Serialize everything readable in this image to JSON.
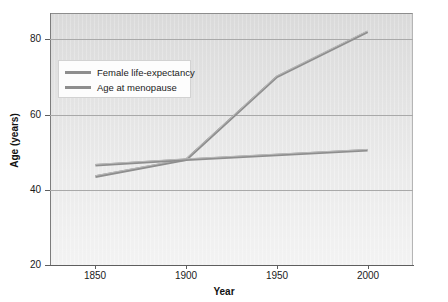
{
  "chart_data": {
    "type": "line",
    "title": "",
    "xlabel": "Year",
    "ylabel": "Age (years)",
    "xlim": [
      1825,
      2025
    ],
    "ylim": [
      20,
      87
    ],
    "xticks": [
      1850,
      1900,
      1950,
      2000
    ],
    "yticks": [
      20,
      40,
      60,
      80
    ],
    "xtick_labels": [
      "1850",
      "1900",
      "1950",
      "2000"
    ],
    "ytick_labels": [
      "20",
      "40",
      "60",
      "80"
    ],
    "grid": "horizontal",
    "legend_position": "upper-left-inside",
    "plot_background": "#e4e4e4",
    "line_color": "#8e8e8e",
    "series": [
      {
        "name": "Female life-expectancy",
        "x": [
          1850,
          1900,
          1950,
          2000
        ],
        "values": [
          43.5,
          48.0,
          70.0,
          82.0
        ]
      },
      {
        "name": "Age at menopause",
        "x": [
          1850,
          1900,
          2000
        ],
        "values": [
          46.5,
          48.0,
          50.5
        ]
      }
    ]
  },
  "legend": {
    "items": [
      {
        "label": "Female life-expectancy"
      },
      {
        "label": "Age at menopause"
      }
    ]
  },
  "axes": {
    "x_title": "Year",
    "y_title": "Age (years)"
  }
}
